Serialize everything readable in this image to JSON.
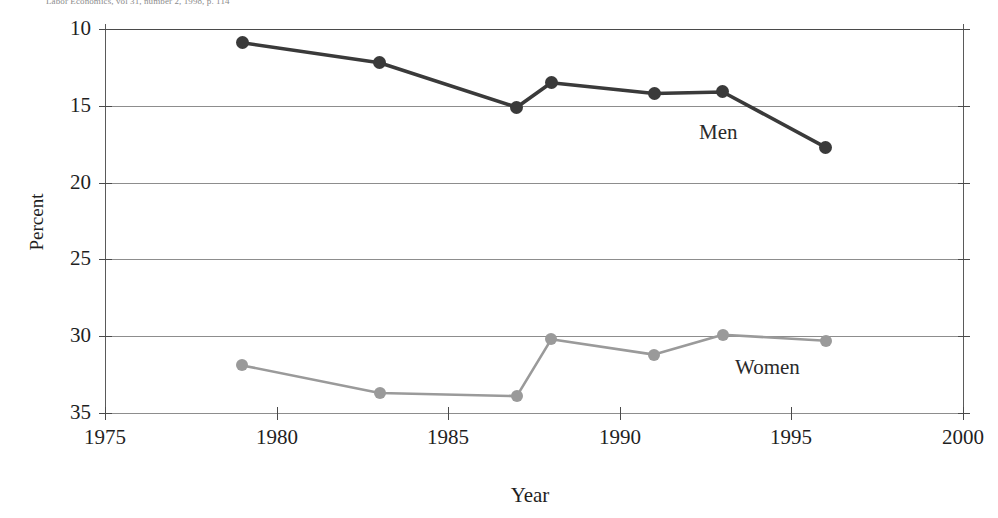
{
  "caption": {
    "source_line": "Labor Economics, vol 31, number 2, 1998, p. 114"
  },
  "chart_data": {
    "type": "line",
    "title": "",
    "subtitle": "",
    "xlabel": "Year",
    "ylabel": "Percent",
    "xlim": [
      1975,
      2000
    ],
    "ylim": [
      10,
      35
    ],
    "xticks": [
      "1975",
      "1980",
      "1985",
      "1990",
      "1995",
      "2000"
    ],
    "yticks": [
      "10",
      "15",
      "20",
      "25",
      "30",
      "35"
    ],
    "grid": "horizontal",
    "legend_position": "inline-annotation",
    "series": [
      {
        "name": "Men",
        "color": "#3a3a3a",
        "marker": "circle",
        "x": [
          1979,
          1983,
          1987,
          1988,
          1991,
          1993,
          1996
        ],
        "values": [
          34.1,
          32.8,
          29.9,
          31.5,
          30.8,
          30.9,
          27.3
        ]
      },
      {
        "name": "Women",
        "color": "#9a9a9a",
        "marker": "circle",
        "x": [
          1979,
          1983,
          1987,
          1988,
          1991,
          1993,
          1996
        ],
        "values": [
          13.1,
          11.3,
          11.1,
          14.8,
          13.8,
          15.1,
          14.7
        ]
      }
    ],
    "annotations": [
      {
        "text": "Men",
        "x": 1992.3,
        "y": 26.9
      },
      {
        "text": "Women",
        "x": 1993.4,
        "y": 11.8
      }
    ]
  },
  "axis": {
    "y_tick_values": [
      35,
      30,
      25,
      20,
      15,
      10
    ],
    "x_tick_values": [
      1975,
      1980,
      1985,
      1990,
      1995,
      2000
    ]
  },
  "colors": {
    "men_line": "#3a3a3a",
    "women_line": "#9a9a9a",
    "grid": "#8d8d8d",
    "axis": "#5a5a5a",
    "text": "#1f1f1f",
    "background": "#ffffff"
  }
}
